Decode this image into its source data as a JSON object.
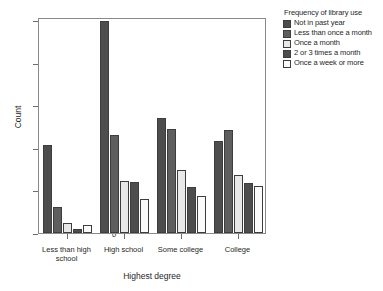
{
  "chart_data": {
    "type": "bar",
    "title": "",
    "xlabel": "Highest degree",
    "ylabel": "Count",
    "categories": [
      "Less than high school",
      "High school",
      "Some college",
      "College"
    ],
    "ylim": [
      0,
      500
    ],
    "yticks": [
      0,
      100,
      200,
      300,
      400,
      500
    ],
    "grid": false,
    "legend_position": "right",
    "legend_title": "Frequency of library use",
    "series": [
      {
        "name": "Not in past year",
        "color": "#4d4d4d",
        "values": [
          207,
          497,
          270,
          215
        ]
      },
      {
        "name": "Less than once a month",
        "color": "#5e5e5e",
        "values": [
          62,
          229,
          245,
          242
        ]
      },
      {
        "name": "Once a month",
        "color": "#e8e8e8",
        "values": [
          24,
          122,
          147,
          136
        ]
      },
      {
        "name": "2 or 3 times a month",
        "color": "#4d4d4d",
        "values": [
          10,
          120,
          108,
          117
        ]
      },
      {
        "name": "Once a week or more",
        "color": "#fbfbfb",
        "values": [
          18,
          81,
          88,
          110
        ]
      }
    ]
  },
  "axis": {
    "y_tick_labels": [
      "0",
      "100",
      "200",
      "300",
      "400",
      "500"
    ],
    "x_tick_labels": [
      "Less than high school",
      "High school",
      "Some college",
      "College"
    ]
  }
}
